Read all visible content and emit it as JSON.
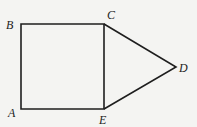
{
  "diagram": {
    "type": "geometry",
    "shapes": [
      {
        "name": "square",
        "vertices": [
          "A",
          "B",
          "C",
          "E"
        ]
      },
      {
        "name": "triangle",
        "vertices": [
          "C",
          "D",
          "E"
        ]
      }
    ],
    "points": {
      "A": {
        "label": "A",
        "x": 21,
        "y": 109
      },
      "B": {
        "label": "B",
        "x": 21,
        "y": 24
      },
      "C": {
        "label": "C",
        "x": 104,
        "y": 24
      },
      "D": {
        "label": "D",
        "x": 176,
        "y": 67
      },
      "E": {
        "label": "E",
        "x": 104,
        "y": 109
      }
    },
    "colors": {
      "line": "#1e1e1e",
      "background": "#f4f4f2"
    }
  }
}
